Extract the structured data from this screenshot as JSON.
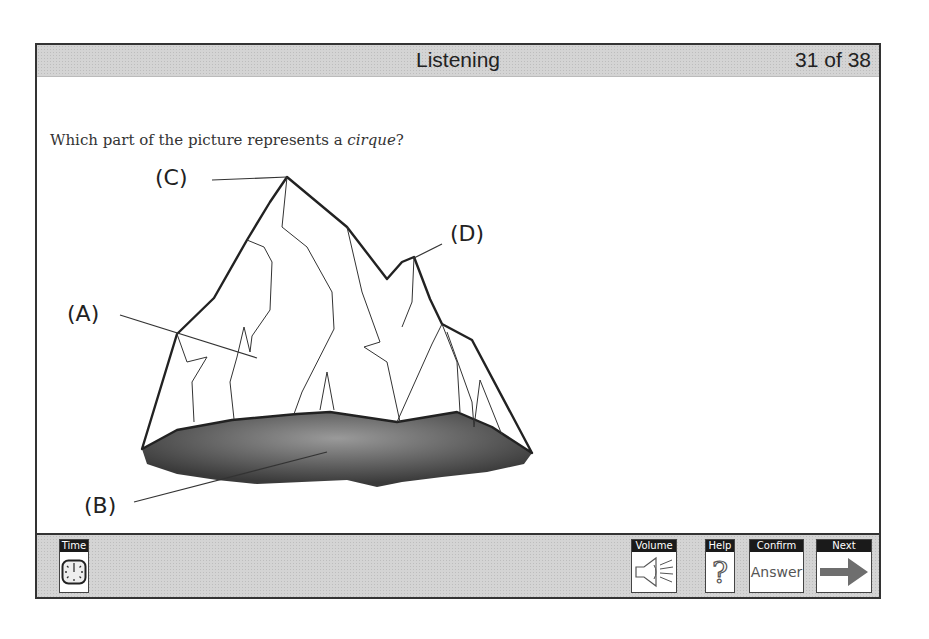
{
  "header": {
    "section_title": "Listening",
    "question_counter": "31 of 38"
  },
  "question": {
    "prefix": "Which part of the picture represents a ",
    "term": "cirque",
    "suffix": "?"
  },
  "figure": {
    "labels": {
      "a": "(A)",
      "b": "(B)",
      "c": "(C)",
      "d": "(D)"
    },
    "colors": {
      "outline": "#222222",
      "shadow_dark": "#3a3a3a",
      "shadow_light": "#9a9a9a"
    }
  },
  "toolbar": {
    "time": {
      "caption": "Time",
      "icon": "clock-icon"
    },
    "volume": {
      "caption": "Volume",
      "icon": "speaker-icon"
    },
    "help": {
      "caption": "Help",
      "glyph": "?"
    },
    "confirm": {
      "caption": "Confirm",
      "text": "Answer"
    },
    "next": {
      "caption": "Next",
      "icon": "arrow-right-icon"
    }
  }
}
